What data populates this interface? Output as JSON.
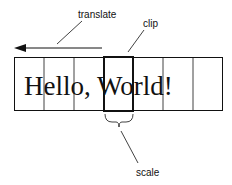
{
  "labels": {
    "translate": "translate",
    "clip": "clip",
    "scale": "scale"
  },
  "glyph_cells": [
    "H",
    "el",
    "lo",
    ",",
    "W",
    "orld",
    "!"
  ],
  "text": "Hello, World!",
  "colors": {
    "stroke": "#111111",
    "background": "#ffffff"
  }
}
